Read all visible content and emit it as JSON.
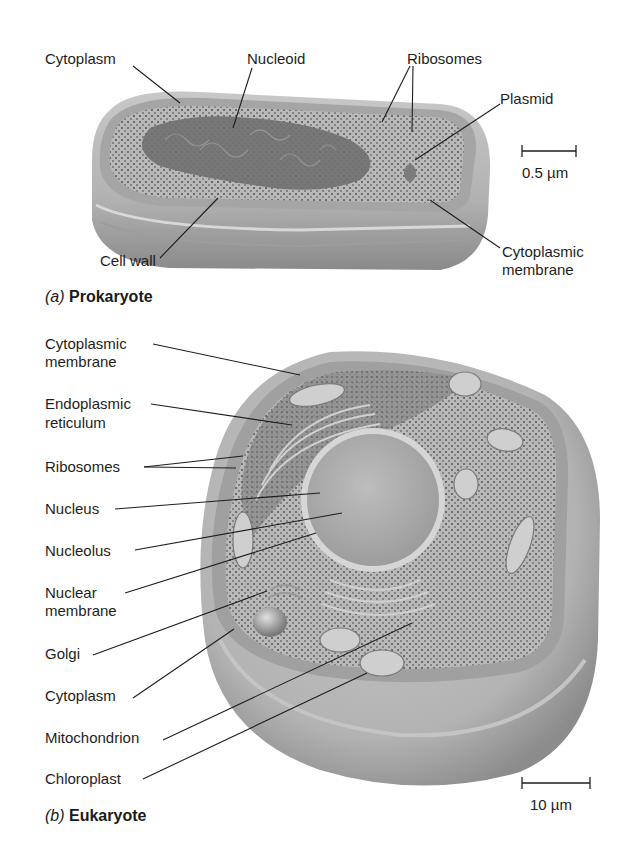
{
  "prokaryote": {
    "caption_letter": "(a)",
    "caption_title": "Prokaryote",
    "scale_bar": "0.5 µm",
    "labels": {
      "cytoplasm": "Cytoplasm",
      "nucleoid": "Nucleoid",
      "ribosomes": "Ribosomes",
      "plasmid": "Plasmid",
      "cell_wall": "Cell wall",
      "cytoplasmic_membrane_1": "Cytoplasmic",
      "cytoplasmic_membrane_2": "membrane"
    }
  },
  "eukaryote": {
    "caption_letter": "(b)",
    "caption_title": "Eukaryote",
    "scale_bar": "10 µm",
    "labels": {
      "cytoplasmic_membrane_1": "Cytoplasmic",
      "cytoplasmic_membrane_2": "membrane",
      "er_1": "Endoplasmic",
      "er_2": "reticulum",
      "ribosomes": "Ribosomes",
      "nucleus": "Nucleus",
      "nucleolus": "Nucleolus",
      "nuclear_membrane_1": "Nuclear",
      "nuclear_membrane_2": "membrane",
      "golgi": "Golgi",
      "cytoplasm": "Cytoplasm",
      "mitochondrion": "Mitochondrion",
      "chloroplast": "Chloroplast"
    }
  },
  "colors": {
    "background": "#ffffff",
    "cell_wall": "#b8b8b8",
    "cytoplasm": "#a9a9a9",
    "nucleoid": "#6f6f6f",
    "nucleus": "#b3b3b3",
    "leader_lines": "#1e1e1e"
  }
}
